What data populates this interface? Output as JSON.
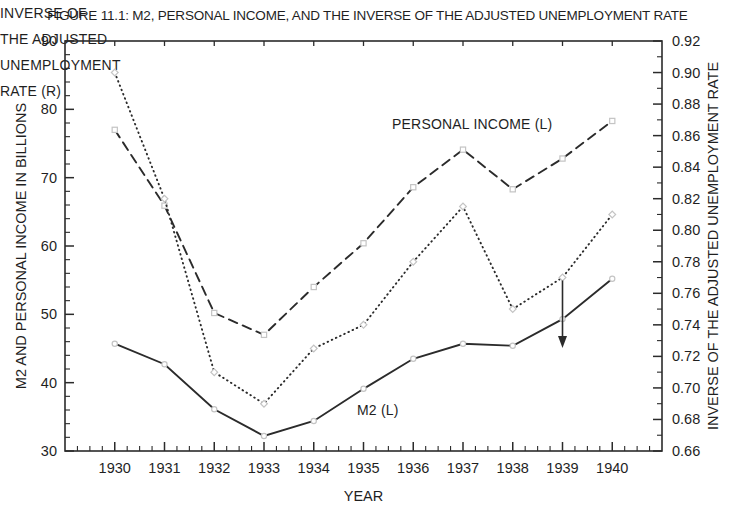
{
  "title": "FIGURE 11.1: M2, PERSONAL INCOME, AND THE INVERSE OF THE ADJUSTED UNEMPLOYMENT RATE",
  "axes": {
    "left": {
      "label": "M2 AND PERSONAL INCOME IN BILLIONS",
      "min": 30,
      "max": 90,
      "major_ticks": [
        30,
        40,
        50,
        60,
        70,
        80,
        90
      ],
      "minor_step": 2
    },
    "right": {
      "label": "INVERSE OF THE ADJUSTED UNEMPLOYMENT RATE",
      "min": 0.66,
      "max": 0.92,
      "major_ticks": [
        "0.66",
        "0.68",
        "0.70",
        "0.72",
        "0.74",
        "0.76",
        "0.78",
        "0.80",
        "0.82",
        "0.84",
        "0.86",
        "0.88",
        "0.90",
        "0.92"
      ],
      "minor_step": 0.01
    },
    "x": {
      "label": "YEAR",
      "min": 1929,
      "max": 1941,
      "minor_step": 0.25
    }
  },
  "chart_data": {
    "type": "line",
    "title": "FIGURE 11.1: M2, PERSONAL INCOME, AND THE INVERSE OF THE ADJUSTED UNEMPLOYMENT RATE",
    "x": [
      1930,
      1931,
      1932,
      1933,
      1934,
      1935,
      1936,
      1937,
      1938,
      1939,
      1940
    ],
    "xlabel": "YEAR",
    "ylabel_left": "M2 AND PERSONAL INCOME IN BILLIONS",
    "ylabel_right": "INVERSE OF THE ADJUSTED UNEMPLOYMENT RATE",
    "ylim_left": [
      30,
      90
    ],
    "ylim_right": [
      0.66,
      0.92
    ],
    "grid": false,
    "legend": "inline-annotations",
    "series": [
      {
        "name": "PERSONAL INCOME (L)",
        "axis": "left",
        "style": "dashed",
        "marker": "square",
        "values": [
          77.0,
          65.9,
          50.2,
          47.0,
          54.0,
          60.4,
          68.6,
          74.1,
          68.3,
          72.8,
          78.3
        ]
      },
      {
        "name": "M2 (L)",
        "axis": "left",
        "style": "solid",
        "marker": "circle",
        "values": [
          45.7,
          42.7,
          36.1,
          32.2,
          34.4,
          39.1,
          43.5,
          45.7,
          45.4,
          49.3,
          55.2
        ]
      },
      {
        "name": "INVERSE OF THE ADJUSTED UNEMPLOYMENT RATE (R)",
        "axis": "right",
        "style": "dotted",
        "marker": "diamond",
        "values": [
          0.9,
          0.82,
          0.71,
          0.69,
          0.725,
          0.74,
          0.78,
          0.815,
          0.75,
          0.77,
          0.81
        ]
      }
    ]
  },
  "annotations": {
    "personal_income_label": "PERSONAL INCOME (L)",
    "m2_label": "M2 (L)",
    "inverse_label_lines": {
      "0": "INVERSE OF",
      "1": "THE ADJUSTED",
      "2": "UNEMPLOYMENT",
      "3": "RATE (R)"
    },
    "arrow_points_to_year": 1939
  },
  "colors": {
    "line": "#2b2b2b",
    "text": "#1f1f1f",
    "marker": "#c4c4c4",
    "background": "#ffffff"
  }
}
